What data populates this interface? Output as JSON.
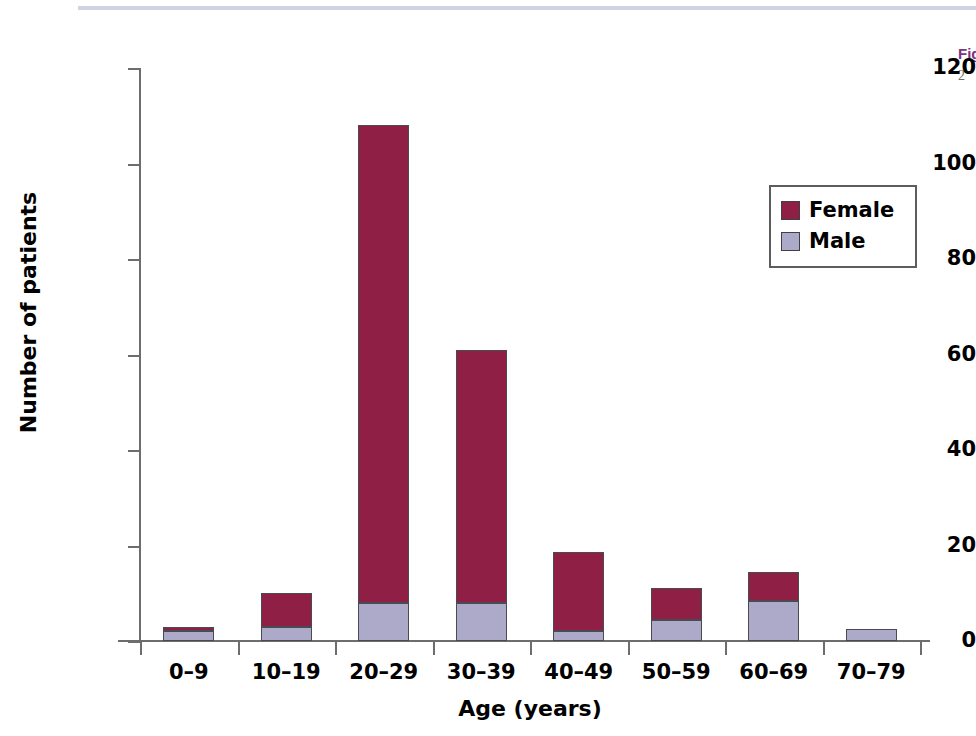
{
  "caption": {
    "title_fragment": "Fig",
    "body_fragment": "2"
  },
  "chart_data": {
    "type": "bar",
    "subtype": "stacked-vertical",
    "title": "",
    "xlabel": "Age (years)",
    "ylabel": "Number of patients",
    "categories": [
      "0–9",
      "10–19",
      "20–29",
      "30–39",
      "40–49",
      "50–59",
      "60–69",
      "70–79"
    ],
    "series": [
      {
        "name": "Male",
        "color": "#adaac9",
        "values": [
          2,
          3,
          8,
          8,
          2,
          4.5,
          8.4,
          2.5
        ]
      },
      {
        "name": "Female",
        "color": "#8f1f44",
        "values": [
          1,
          7,
          100,
          53,
          16.6,
          6.5,
          6,
          0
        ]
      }
    ],
    "totals": [
      3,
      10,
      108,
      61,
      18.6,
      11,
      14.4,
      2.5
    ],
    "ylim": [
      0,
      120
    ],
    "yticks": [
      0,
      20,
      40,
      60,
      80,
      100,
      120
    ],
    "ytick_labels": [
      "0",
      "20",
      "40",
      "60",
      "80",
      "100",
      "120"
    ],
    "grid": false,
    "legend_position": "upper right",
    "legend_entries": [
      {
        "label": "Female",
        "color": "#8f1f44"
      },
      {
        "label": "Male",
        "color": "#adaac9"
      }
    ]
  },
  "colors": {
    "female": "#8f1f44",
    "male": "#adaac9",
    "axis": "#6d6d6d",
    "bar_outline": "#4a4a52",
    "caption_accent": "#7b3382"
  }
}
